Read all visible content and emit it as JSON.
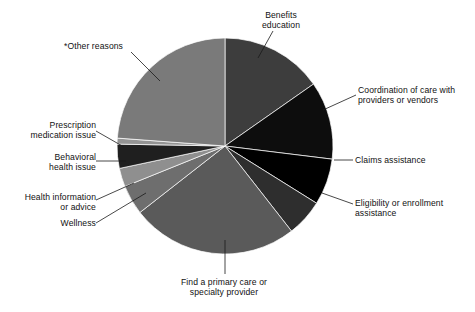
{
  "chart_data": {
    "type": "pie",
    "title": "",
    "subtitle": "",
    "xlabel": "",
    "ylabel": "",
    "legend_position": "callout-labels",
    "grid": false,
    "start_angle_deg": 0,
    "direction": "clockwise",
    "center": {
      "x": 225,
      "y": 146
    },
    "radius": 108,
    "categories": [
      "Benefits education",
      "Coordination of care with providers or vendors",
      "Claims assistance",
      "Eligibility or enrollment assistance",
      "Find a primary care or specialty provider",
      "Wellness",
      "Health information or advice",
      "Behavioral health issue",
      "Prescription medication issue",
      "*Other reasons"
    ],
    "values": [
      15.3,
      11.7,
      6.9,
      5.6,
      25.0,
      4.4,
      2.8,
      3.6,
      0.9,
      23.8
    ],
    "value_unit": "percent",
    "colors": [
      "#3d3d3d",
      "#0d0d0d",
      "#000000",
      "#2e2e2e",
      "#5a5a5a",
      "#6e6e6e",
      "#8f8f8f",
      "#1f1f1f",
      "#949494",
      "#7a7a7a"
    ],
    "slices": [
      {
        "label": "Benefits education",
        "value": 15.3,
        "start_deg": 0.0,
        "end_deg": 55.0,
        "color": "#3d3d3d"
      },
      {
        "label": "Coordination of care with providers or vendors",
        "value": 11.7,
        "start_deg": 55.0,
        "end_deg": 97.0,
        "color": "#0d0d0d"
      },
      {
        "label": "Claims assistance",
        "value": 6.9,
        "start_deg": 97.0,
        "end_deg": 122.0,
        "color": "#000000"
      },
      {
        "label": "Eligibility or enrollment assistance",
        "value": 5.6,
        "start_deg": 122.0,
        "end_deg": 142.0,
        "color": "#2e2e2e"
      },
      {
        "label": "Find a primary care or specialty provider",
        "value": 25.0,
        "start_deg": 142.0,
        "end_deg": 232.0,
        "color": "#5a5a5a"
      },
      {
        "label": "Wellness",
        "value": 4.4,
        "start_deg": 232.0,
        "end_deg": 248.0,
        "color": "#6e6e6e"
      },
      {
        "label": "Health information or advice",
        "value": 2.8,
        "start_deg": 248.0,
        "end_deg": 258.0,
        "color": "#8f8f8f"
      },
      {
        "label": "Behavioral health issue",
        "value": 3.6,
        "start_deg": 258.0,
        "end_deg": 271.0,
        "color": "#1f1f1f"
      },
      {
        "label": "Prescription medication issue",
        "value": 0.9,
        "start_deg": 271.0,
        "end_deg": 274.2,
        "color": "#949494"
      },
      {
        "label": "*Other reasons",
        "value": 23.8,
        "start_deg": 274.2,
        "end_deg": 360.0,
        "color": "#7a7a7a"
      }
    ]
  },
  "labels": {
    "benefits": "Benefits\neducation",
    "coordination": "Coordination of care with\nproviders or vendors",
    "claims": "Claims assistance",
    "eligibility": "Eligibility or enrollment\nassistance",
    "find_provider": "Find a primary care or\nspecialty provider",
    "wellness": "Wellness",
    "health_info": "Health information\nor advice",
    "behavioral": "Behavioral\nhealth issue",
    "prescription": "Prescription\nmedication issue",
    "other": "*Other reasons"
  },
  "leader_lines": [
    {
      "name": "benefits",
      "x1": 273,
      "y1": 31,
      "x2": 258,
      "y2": 58
    },
    {
      "name": "coordination",
      "x1": 356,
      "y1": 95,
      "x2": 323,
      "y2": 110
    },
    {
      "name": "claims",
      "x1": 353,
      "y1": 160,
      "x2": 334,
      "y2": 160
    },
    {
      "name": "eligibility",
      "x1": 353,
      "y1": 204,
      "x2": 322,
      "y2": 193
    },
    {
      "name": "find_provider",
      "x1": 225,
      "y1": 274,
      "x2": 225,
      "y2": 240
    },
    {
      "name": "wellness",
      "x1": 96,
      "y1": 223,
      "x2": 146,
      "y2": 193
    },
    {
      "name": "health_info",
      "x1": 96,
      "y1": 200,
      "x2": 134,
      "y2": 183
    },
    {
      "name": "behavioral",
      "x1": 96,
      "y1": 161,
      "x2": 126,
      "y2": 161
    },
    {
      "name": "prescription",
      "x1": 96,
      "y1": 131,
      "x2": 124,
      "y2": 147
    },
    {
      "name": "other",
      "x1": 131,
      "y1": 52,
      "x2": 160,
      "y2": 81
    }
  ]
}
